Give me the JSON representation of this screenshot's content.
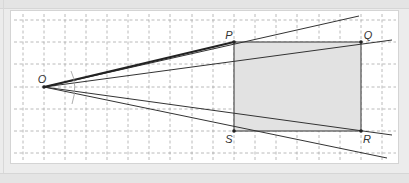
{
  "diagram": {
    "type": "geometry-similar-triangles",
    "points": {
      "O": {
        "label": "O",
        "x": 44,
        "y": 87
      },
      "P": {
        "label": "P",
        "x": 234,
        "y": 42
      },
      "Q": {
        "label": "Q",
        "x": 361,
        "y": 42
      },
      "R": {
        "label": "R",
        "x": 361,
        "y": 131
      },
      "S": {
        "label": "S",
        "x": 234,
        "y": 131
      }
    },
    "shaded_region": "PQRS",
    "colors": {
      "grid": "#9a9a9a",
      "lines": "#333333",
      "shade": "#e3e3e3",
      "panel": "#ffffff",
      "frame": "#ececec"
    }
  }
}
